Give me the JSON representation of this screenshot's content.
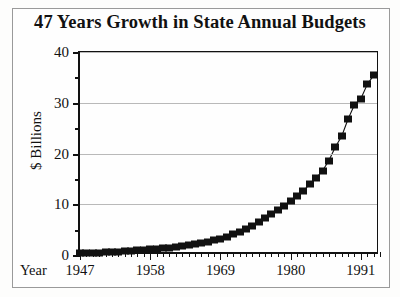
{
  "title": "47 Years Growth in State Annual Budgets",
  "axis": {
    "ylabel": "$ Billions",
    "xlabel": "Year"
  },
  "chart_data": {
    "type": "line",
    "title": "47 Years Growth in State Annual Budgets",
    "xlabel": "Year",
    "ylabel": "$ Billions",
    "xlim": [
      1947,
      1994
    ],
    "ylim": [
      0,
      40
    ],
    "grid": true,
    "legend": false,
    "marker": "square",
    "marker_color": "#111111",
    "line_color": "#111111",
    "xticks": [
      1947,
      1958,
      1969,
      1980,
      1991
    ],
    "xtick_labels": [
      "1947",
      "1958",
      "1969",
      "1980",
      "1991"
    ],
    "xtick_minor_step": 1,
    "yticks": [
      0,
      10,
      20,
      30,
      40
    ],
    "ytick_labels": [
      "0",
      "10",
      "20",
      "30",
      "40"
    ],
    "ytick_minor": [
      5,
      15,
      25,
      35
    ],
    "x": [
      1947,
      1948,
      1949,
      1950,
      1951,
      1952,
      1953,
      1954,
      1955,
      1956,
      1957,
      1958,
      1959,
      1960,
      1961,
      1962,
      1963,
      1964,
      1965,
      1966,
      1967,
      1968,
      1969,
      1970,
      1971,
      1972,
      1973,
      1974,
      1975,
      1976,
      1977,
      1978,
      1979,
      1980,
      1981,
      1982,
      1983,
      1984,
      1985,
      1986,
      1987,
      1988,
      1989,
      1990,
      1991,
      1992,
      1993
    ],
    "values": [
      0.3,
      0.35,
      0.4,
      0.45,
      0.5,
      0.55,
      0.6,
      0.7,
      0.8,
      0.9,
      1.0,
      1.1,
      1.2,
      1.3,
      1.45,
      1.6,
      1.75,
      1.9,
      2.1,
      2.3,
      2.6,
      2.9,
      3.2,
      3.6,
      4.1,
      4.6,
      5.2,
      5.8,
      6.5,
      7.2,
      8.0,
      8.8,
      9.6,
      10.6,
      11.6,
      12.7,
      13.9,
      15.2,
      16.6,
      18.6,
      21.3,
      23.4,
      26.8,
      29.6,
      30.8,
      33.6,
      35.4
    ]
  }
}
